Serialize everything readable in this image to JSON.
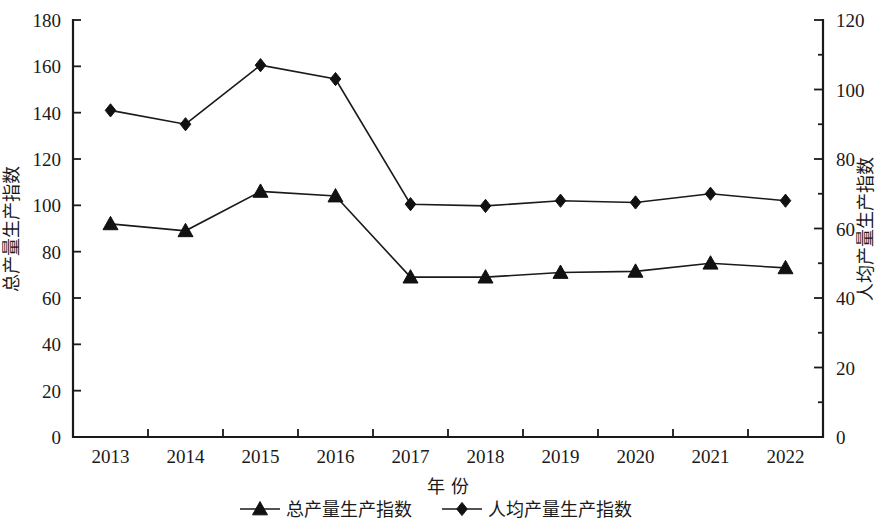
{
  "chart_data": {
    "type": "line",
    "title": "",
    "subtitle": "",
    "xlabel": "年  份",
    "ylabel": "总产量生产指数",
    "y2label": "人均产量生产指数",
    "categories": [
      "2013",
      "2014",
      "2015",
      "2016",
      "2017",
      "2018",
      "2019",
      "2020",
      "2021",
      "2022"
    ],
    "xlim": [
      "2013",
      "2022"
    ],
    "ylim": [
      0,
      180
    ],
    "y2lim": [
      0,
      120
    ],
    "yticks": [
      0,
      20,
      40,
      60,
      80,
      100,
      120,
      140,
      160,
      180
    ],
    "y2ticks": [
      0,
      20,
      40,
      60,
      80,
      100,
      120
    ],
    "grid": false,
    "legend_position": "bottom",
    "series": [
      {
        "name": "总产量生产指数",
        "axis": "left",
        "marker": "triangle",
        "color": "#111111",
        "values": [
          92,
          89,
          106,
          104,
          69,
          69,
          71,
          71.5,
          75,
          73
        ]
      },
      {
        "name": "人均产量生产指数",
        "axis": "right",
        "marker": "diamond",
        "color": "#111111",
        "values": [
          94,
          90,
          107,
          103,
          67,
          66.5,
          68,
          67.5,
          70,
          68
        ]
      }
    ],
    "annotations": []
  },
  "legend": {
    "items": [
      {
        "label": "总产量生产指数",
        "marker": "triangle"
      },
      {
        "label": "人均产量生产指数",
        "marker": "diamond"
      }
    ]
  }
}
